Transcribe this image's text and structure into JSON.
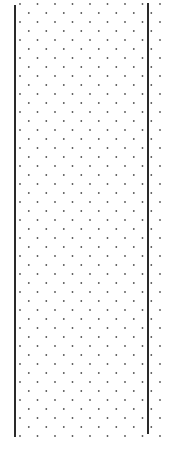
{
  "canvas": {
    "width": 170,
    "height": 449,
    "background": "#ffffff"
  },
  "pattern": {
    "type": "staggered-dot-grid",
    "dot_color": "#555555",
    "dot_radius": 0.9,
    "row_spacing": 9,
    "col_spacing": 17.5,
    "stagger_offset": 8.75,
    "x_start": 20,
    "x_end": 160,
    "y_start": 4,
    "y_end": 440
  },
  "lines": {
    "left": {
      "x": 14,
      "y1": 5,
      "y2": 437,
      "color": "#2a2a2a"
    },
    "right": {
      "x": 147,
      "y1": 3,
      "y2": 434,
      "color": "#2a2a2a"
    }
  }
}
